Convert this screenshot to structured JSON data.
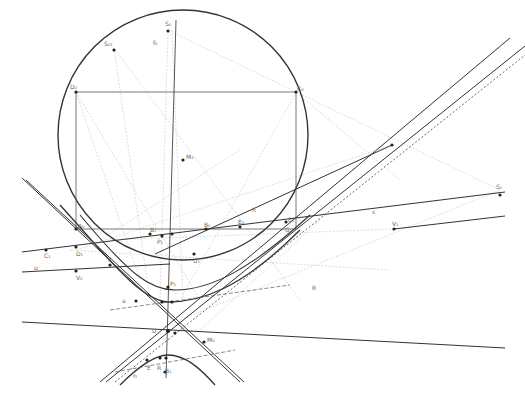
{
  "diagram": {
    "type": "geometric-construction",
    "background": "#ffffff",
    "colors": {
      "bold": "#333333",
      "thin": "#777777",
      "faint": "#c8c8c8",
      "point": "#222222",
      "label": "#666666"
    },
    "labels": {
      "S0": "S₀",
      "S01": "S₀₁",
      "f0": "f₀",
      "D2": "D₂",
      "C0": "C₀",
      "M3": "M₃",
      "A0": "A₀",
      "B1": "B₁",
      "P1": "P₁",
      "B0": "B₀",
      "E0": "E₀",
      "h": "h",
      "s": "s",
      "S1": "S₁",
      "V1": "V₁",
      "C1": "C₁",
      "D1": "D₁",
      "V2": "V₂",
      "F": "F",
      "U1": "U₁",
      "P2": "P₂",
      "G": "G",
      "E1": "E₁",
      "R": "R",
      "a": "a",
      "u": "u",
      "U": "U",
      "M0": "M₀",
      "E": "E",
      "R2": "R",
      "B2": "B₁",
      "n": "n"
    }
  }
}
